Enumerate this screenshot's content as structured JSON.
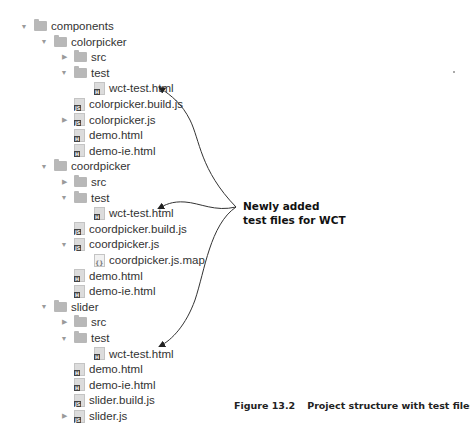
{
  "tree": {
    "rows": [
      {
        "label": "components",
        "type": "folder",
        "depth": 0,
        "toggle": "expanded"
      },
      {
        "label": "colorpicker",
        "type": "folder",
        "depth": 1,
        "toggle": "expanded"
      },
      {
        "label": "src",
        "type": "folder",
        "depth": 2,
        "toggle": "collapsed"
      },
      {
        "label": "test",
        "type": "folder",
        "depth": 2,
        "toggle": "expanded"
      },
      {
        "label": "wct-test.html",
        "type": "html-file",
        "depth": 3,
        "toggle": "none",
        "icon_badge": "H"
      },
      {
        "label": "colorpicker.build.js",
        "type": "js-file",
        "depth": 2,
        "toggle": "none",
        "icon_badge": "JS"
      },
      {
        "label": "colorpicker.js",
        "type": "js-file",
        "depth": 2,
        "toggle": "collapsed",
        "icon_badge": "JS"
      },
      {
        "label": "demo.html",
        "type": "html-file",
        "depth": 2,
        "toggle": "none",
        "icon_badge": "H"
      },
      {
        "label": "demo-ie.html",
        "type": "html-file",
        "depth": 2,
        "toggle": "none",
        "icon_badge": "H"
      },
      {
        "label": "coordpicker",
        "type": "folder",
        "depth": 1,
        "toggle": "expanded"
      },
      {
        "label": "src",
        "type": "folder",
        "depth": 2,
        "toggle": "collapsed"
      },
      {
        "label": "test",
        "type": "folder",
        "depth": 2,
        "toggle": "expanded"
      },
      {
        "label": "wct-test.html",
        "type": "html-file",
        "depth": 3,
        "toggle": "none",
        "icon_badge": "H"
      },
      {
        "label": "coordpicker.build.js",
        "type": "js-file",
        "depth": 2,
        "toggle": "none",
        "icon_badge": "JS"
      },
      {
        "label": "coordpicker.js",
        "type": "js-file",
        "depth": 2,
        "toggle": "expanded",
        "icon_badge": "JS"
      },
      {
        "label": "coordpicker.js.map",
        "type": "map-file",
        "depth": 3,
        "toggle": "none",
        "icon_badge": "{}"
      },
      {
        "label": "demo.html",
        "type": "html-file",
        "depth": 2,
        "toggle": "none",
        "icon_badge": "H"
      },
      {
        "label": "demo-ie.html",
        "type": "html-file",
        "depth": 2,
        "toggle": "none",
        "icon_badge": "H"
      },
      {
        "label": "slider",
        "type": "folder",
        "depth": 1,
        "toggle": "expanded"
      },
      {
        "label": "src",
        "type": "folder",
        "depth": 2,
        "toggle": "collapsed"
      },
      {
        "label": "test",
        "type": "folder",
        "depth": 2,
        "toggle": "expanded"
      },
      {
        "label": "wct-test.html",
        "type": "html-file",
        "depth": 3,
        "toggle": "none",
        "icon_badge": "H"
      },
      {
        "label": "demo.html",
        "type": "html-file",
        "depth": 2,
        "toggle": "none",
        "icon_badge": "H"
      },
      {
        "label": "demo-ie.html",
        "type": "html-file",
        "depth": 2,
        "toggle": "none",
        "icon_badge": "H"
      },
      {
        "label": "slider.build.js",
        "type": "js-file",
        "depth": 2,
        "toggle": "none",
        "icon_badge": "JS"
      },
      {
        "label": "slider.js",
        "type": "js-file",
        "depth": 2,
        "toggle": "collapsed",
        "icon_badge": "JS"
      }
    ]
  },
  "callout": {
    "line1": "Newly added",
    "line2": "test files for WCT",
    "targets": [
      "colorpicker/test/wct-test.html",
      "coordpicker/test/wct-test.html",
      "slider/test/wct-test.html"
    ]
  },
  "caption": {
    "figure": "Figure 13.2",
    "text": "Project structure with test files"
  },
  "glyphs": {
    "expanded": "▼",
    "collapsed": "▶"
  },
  "colors": {
    "text": "#333333",
    "folder": "#b8b8b8",
    "arrow": "#333333",
    "callout": "#111111"
  }
}
